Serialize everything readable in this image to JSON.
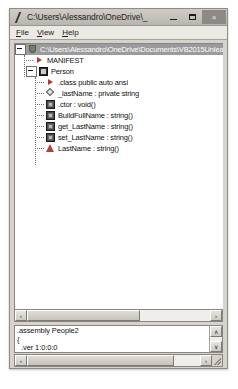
{
  "window": {
    "title": "C:\\Users\\Alessandro\\OneDrive\\_",
    "icon": "ildasm-icon",
    "buttons": {
      "minimize": "minimize-button",
      "maximize": "maximize-button",
      "close_label": "×"
    }
  },
  "menu": {
    "items": [
      {
        "label": "File",
        "accel": "F"
      },
      {
        "label": "View",
        "accel": "V"
      },
      {
        "label": "Help",
        "accel": "H"
      }
    ]
  },
  "tree": {
    "rows": [
      {
        "label": "C:\\Users\\Alessandro\\OneDrive\\Documents\\VB2015Unleashed\\",
        "icon": "assembly-shield-icon",
        "depth": 0,
        "expander": "minus",
        "selected": true
      },
      {
        "label": "MANIFEST",
        "icon": "manifest-arrow-icon",
        "depth": 1,
        "expander": "none",
        "selected": false
      },
      {
        "label": "Person",
        "icon": "class-icon",
        "depth": 1,
        "expander": "minus",
        "selected": false
      },
      {
        "label": ".class public auto ansi",
        "icon": "class-info-arrow-icon",
        "depth": 2,
        "expander": "none",
        "selected": false
      },
      {
        "label": "_lastName : private string",
        "icon": "field-icon",
        "depth": 2,
        "expander": "none",
        "selected": false
      },
      {
        "label": ".ctor : void()",
        "icon": "method-icon",
        "depth": 2,
        "expander": "none",
        "selected": false
      },
      {
        "label": "BuildFullName : string()",
        "icon": "method-icon",
        "depth": 2,
        "expander": "none",
        "selected": false
      },
      {
        "label": "get_LastName : string()",
        "icon": "method-icon",
        "depth": 2,
        "expander": "none",
        "selected": false
      },
      {
        "label": "set_LastName : string()",
        "icon": "method-icon",
        "depth": 2,
        "expander": "none",
        "selected": false
      },
      {
        "label": "LastName : string()",
        "icon": "property-icon",
        "depth": 2,
        "expander": "none",
        "selected": false
      }
    ],
    "hscroll": {
      "left_arrow": "‹",
      "right_arrow": "›"
    }
  },
  "detail": {
    "lines": [
      {
        "text": ".assembly People2",
        "indent": false
      },
      {
        "text": "{",
        "indent": false
      },
      {
        "text": ".ver 1:0:0:0",
        "indent": true
      }
    ],
    "vscroll": {
      "up_arrow": "∧",
      "down_arrow": "∨"
    },
    "hscroll": {
      "left_arrow": "‹",
      "right_arrow": "›"
    }
  },
  "colors": {
    "window_face": "#d6d3ce",
    "selection": "#9b9b9b",
    "accent_red": "#a8453f",
    "pane_white": "#ffffff"
  }
}
